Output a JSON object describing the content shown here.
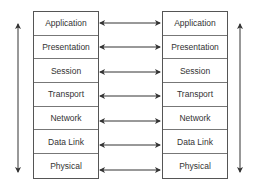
{
  "diagram": {
    "left_stack": {
      "layers": [
        "Application",
        "Presentation",
        "Session",
        "Transport",
        "Network",
        "Data Link",
        "Physical"
      ]
    },
    "right_stack": {
      "layers": [
        "Application",
        "Presentation",
        "Session",
        "Transport",
        "Network",
        "Data Link",
        "Physical"
      ]
    },
    "left_arrow": {
      "direction": "bidirectional-vertical"
    },
    "right_arrow": {
      "direction": "bidirectional-vertical"
    },
    "peer_arrows": {
      "count": 7,
      "direction": "bidirectional-horizontal"
    },
    "colors": {
      "line": "#333333",
      "border": "#555555",
      "text": "#333333",
      "background": "#ffffff"
    }
  }
}
